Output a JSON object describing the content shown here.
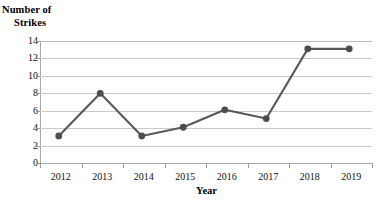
{
  "chart_data": {
    "type": "line",
    "title": "",
    "xlabel": "Year",
    "ylabel": "Number of Strikes",
    "ylabel_lines": [
      "Number of",
      "Strikes"
    ],
    "categories": [
      "2012",
      "2013",
      "2014",
      "2015",
      "2016",
      "2017",
      "2018",
      "2019"
    ],
    "values": [
      3.1,
      8.0,
      3.1,
      4.1,
      6.1,
      5.1,
      13.1,
      13.1
    ],
    "series": [
      {
        "name": "Number of Strikes",
        "values": [
          3.1,
          8.0,
          3.1,
          4.1,
          6.1,
          5.1,
          13.1,
          13.1
        ]
      }
    ],
    "ylim": [
      0,
      14
    ],
    "y_ticks": [
      "0",
      "2",
      "4",
      "6",
      "8",
      "10",
      "12",
      "14"
    ],
    "y_tick_values": [
      0,
      2,
      4,
      6,
      8,
      10,
      12,
      14
    ],
    "grid": true,
    "grid_axis": "y",
    "legend": false,
    "legend_position": "none",
    "marker": "circle",
    "colors": {
      "line": "#595959",
      "marker": "#4d4d4d",
      "grid": "#c9c9c9",
      "axis": "#a8a8a8",
      "text": "#111111",
      "background": "#ffffff"
    }
  }
}
